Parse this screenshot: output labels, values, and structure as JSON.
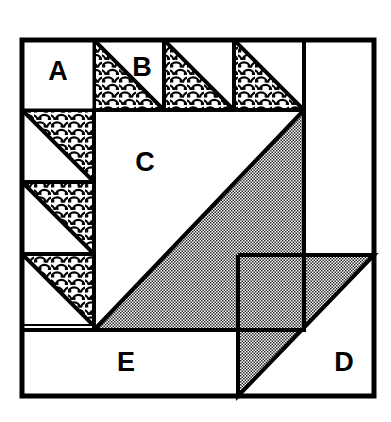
{
  "diagram": {
    "type": "quilt-block",
    "background_color": "#ffffff",
    "line_color": "#000000",
    "fills": {
      "plain": "#ffffff",
      "print": "scallop-pattern",
      "shaded": "#808080"
    },
    "outer_border": {
      "x": 22,
      "y": 40,
      "width": 352,
      "height": 356,
      "stroke_width": 4
    },
    "labels": [
      {
        "id": "A",
        "text": "A",
        "x": 58,
        "y": 72
      },
      {
        "id": "B",
        "text": "B",
        "x": 142,
        "y": 68
      },
      {
        "id": "C",
        "text": "C",
        "x": 145,
        "y": 163
      },
      {
        "id": "D",
        "text": "D",
        "x": 344,
        "y": 363
      },
      {
        "id": "E",
        "text": "E",
        "x": 126,
        "y": 363
      }
    ],
    "patches": {
      "corner_square_a": {
        "name": "A",
        "fill": "plain",
        "x": 22,
        "y": 40,
        "width": 72,
        "height": 70
      },
      "top_triangle_units": [
        {
          "name": "B-1",
          "x": 94,
          "y": 40,
          "size": 70,
          "fill": "print",
          "orientation": "lower-left"
        },
        {
          "name": "B-2",
          "x": 164,
          "y": 40,
          "size": 70,
          "fill": "print",
          "orientation": "lower-left"
        },
        {
          "name": "B-3",
          "x": 234,
          "y": 40,
          "size": 70,
          "fill": "print",
          "orientation": "lower-left"
        }
      ],
      "left_triangle_units": [
        {
          "name": "L-1",
          "x": 22,
          "y": 110,
          "size": 72,
          "fill": "print",
          "orientation": "upper-right"
        },
        {
          "name": "L-2",
          "x": 22,
          "y": 182,
          "size": 72,
          "fill": "print",
          "orientation": "upper-right"
        },
        {
          "name": "L-3",
          "x": 22,
          "y": 254,
          "size": 72,
          "fill": "print",
          "orientation": "upper-right"
        }
      ],
      "center_square_c": {
        "name": "C",
        "x": 94,
        "y": 110,
        "width": 210,
        "height": 220,
        "diagonal": "bottom-left-to-top-right",
        "upper_left_fill": "plain",
        "lower_right_fill": "shaded"
      },
      "right_column": {
        "name": "right-plain-column",
        "fill": "plain",
        "x": 304,
        "y": 40,
        "width": 70,
        "height": 215
      },
      "corner_square_d": {
        "name": "D",
        "x": 238,
        "y": 255,
        "width": 136,
        "height": 141,
        "diagonal": "bottom-left-to-top-right",
        "upper_left_fill": "shaded",
        "lower_right_fill": "plain"
      },
      "bottom_rectangle_e": {
        "name": "E",
        "fill": "plain",
        "x": 22,
        "y": 330,
        "width": 216,
        "height": 66
      }
    }
  }
}
